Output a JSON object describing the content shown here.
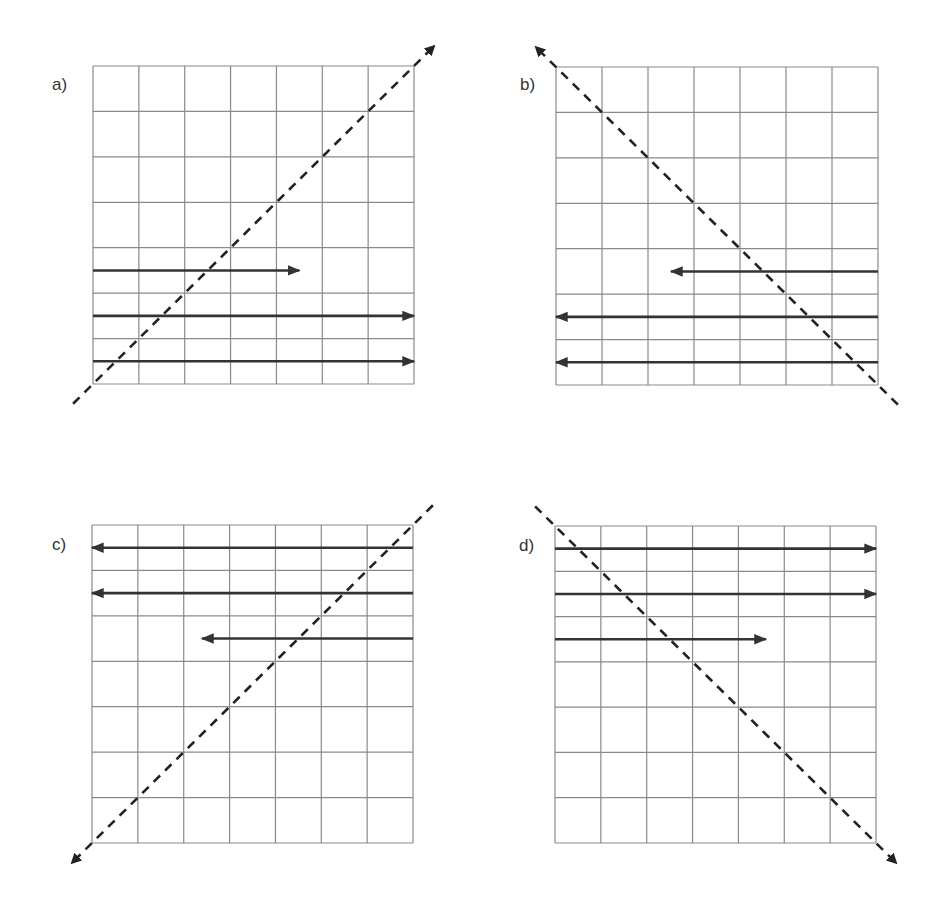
{
  "figure": {
    "grid_size": 7,
    "panels": [
      {
        "id": "a",
        "label": "a)",
        "diagonal": {
          "from": "bottom-left",
          "to": "top-right",
          "arrowhead": "top-right"
        },
        "arrows": [
          {
            "row": 4,
            "direction": "right",
            "start_col": 0,
            "end_col": 4.5
          },
          {
            "row": 5,
            "direction": "right",
            "start_col": 0,
            "end_col": 7
          },
          {
            "row": 6,
            "direction": "right",
            "start_col": 0,
            "end_col": 7
          }
        ]
      },
      {
        "id": "b",
        "label": "b)",
        "diagonal": {
          "from": "bottom-right",
          "to": "top-left",
          "arrowhead": "top-left"
        },
        "arrows": [
          {
            "row": 4,
            "direction": "left",
            "start_col": 7,
            "end_col": 2.5
          },
          {
            "row": 5,
            "direction": "left",
            "start_col": 7,
            "end_col": 0
          },
          {
            "row": 6,
            "direction": "left",
            "start_col": 7,
            "end_col": 0
          }
        ]
      },
      {
        "id": "c",
        "label": "c)",
        "diagonal": {
          "from": "top-right",
          "to": "bottom-left",
          "arrowhead": "bottom-left"
        },
        "arrows": [
          {
            "row": 0,
            "direction": "left",
            "start_col": 7,
            "end_col": 0
          },
          {
            "row": 1,
            "direction": "left",
            "start_col": 7,
            "end_col": 0
          },
          {
            "row": 2,
            "direction": "left",
            "start_col": 7,
            "end_col": 2.4
          }
        ]
      },
      {
        "id": "d",
        "label": "d)",
        "diagonal": {
          "from": "top-left",
          "to": "bottom-right",
          "arrowhead": "bottom-right"
        },
        "arrows": [
          {
            "row": 0,
            "direction": "right",
            "start_col": 0,
            "end_col": 7
          },
          {
            "row": 1,
            "direction": "right",
            "start_col": 0,
            "end_col": 7
          },
          {
            "row": 2,
            "direction": "right",
            "start_col": 0,
            "end_col": 4.6
          }
        ]
      }
    ]
  }
}
